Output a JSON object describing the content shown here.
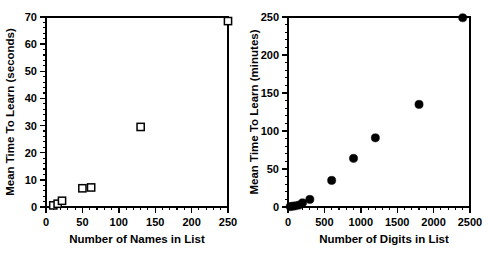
{
  "figure": {
    "background_color": "#ffffff",
    "marker_color": "#000000",
    "axis_color": "#000000"
  },
  "chart_data": [
    {
      "type": "scatter",
      "panel": "left",
      "title": "",
      "xlabel": "Number of Names in List",
      "ylabel": "Mean Time To Learn (seconds)",
      "xlim": [
        0,
        250
      ],
      "ylim": [
        0,
        70
      ],
      "xticks": [
        0,
        50,
        100,
        150,
        200,
        250
      ],
      "yticks": [
        0,
        10,
        20,
        30,
        40,
        50,
        60,
        70
      ],
      "xticklabels": [
        "0",
        "50",
        "100",
        "150",
        "200",
        "250"
      ],
      "yticklabels": [
        "0",
        "10",
        "20",
        "30",
        "40",
        "50",
        "60",
        "70"
      ],
      "x_minor_tick_interval": 10,
      "y_minor_tick_interval": 2,
      "grid": false,
      "legend": false,
      "marker_style": "open-square",
      "x": [
        10,
        16,
        22,
        50,
        62,
        130,
        250
      ],
      "y": [
        0.6,
        1.2,
        2.3,
        6.9,
        7.2,
        29.5,
        68.5
      ]
    },
    {
      "type": "scatter",
      "panel": "right",
      "title": "",
      "xlabel": "Number of Digits in List",
      "ylabel": "Mean Time To Learn (minutes)",
      "xlim": [
        0,
        2500
      ],
      "ylim": [
        0,
        250
      ],
      "xticks": [
        0,
        500,
        1000,
        1500,
        2000,
        2500
      ],
      "yticks": [
        0,
        50,
        100,
        150,
        200,
        250
      ],
      "xticklabels": [
        "0",
        "500",
        "1000",
        "1500",
        "2000",
        "2500"
      ],
      "yticklabels": [
        "0",
        "50",
        "100",
        "150",
        "200",
        "250"
      ],
      "x_minor_tick_interval": 100,
      "y_minor_tick_interval": 10,
      "grid": false,
      "legend": false,
      "marker_style": "filled-circle",
      "x": [
        30,
        60,
        100,
        150,
        200,
        300,
        600,
        900,
        1200,
        1800,
        2400
      ],
      "y": [
        0.5,
        1,
        1.5,
        2.5,
        5.5,
        10,
        35,
        64,
        91,
        135,
        249
      ]
    }
  ]
}
